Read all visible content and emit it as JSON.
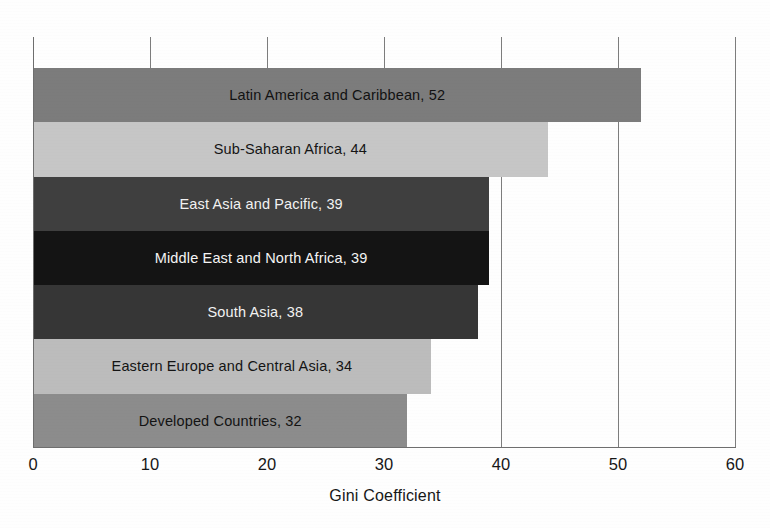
{
  "chart_data": {
    "type": "bar",
    "orientation": "horizontal",
    "title": "",
    "xlabel": "Gini Coefficient",
    "ylabel": "",
    "xlim": [
      0,
      60
    ],
    "xticks": [
      0,
      10,
      20,
      30,
      40,
      50,
      60
    ],
    "xtick_labels": [
      "0",
      "10",
      "20",
      "30",
      "40",
      "50",
      "60"
    ],
    "grid": true,
    "grid_axis": "x",
    "legend": false,
    "categories": [
      "Latin America and Caribbean",
      "Sub-Saharan Africa",
      "East Asia and Pacific",
      "Middle East and North Africa",
      "South Asia",
      "Eastern Europe and Central Asia",
      "Developed Countries"
    ],
    "values": [
      52,
      44,
      39,
      39,
      38,
      34,
      32
    ],
    "bar_labels": [
      "Latin America and Caribbean, 52",
      "Sub-Saharan Africa, 44",
      "East Asia and Pacific, 39",
      "Middle East and North Africa, 39",
      "South Asia, 38",
      "Eastern Europe and Central Asia, 34",
      "Developed Countries, 32"
    ],
    "bar_colors": [
      "#7c7c7c",
      "#c6c6c6",
      "#3f3f3f",
      "#141414",
      "#363636",
      "#bcbcbc",
      "#8c8c8c"
    ],
    "bar_label_colors": [
      "#121212",
      "#151515",
      "#f2f2f2",
      "#f4f4f4",
      "#f2f2f2",
      "#141414",
      "#131313"
    ]
  },
  "axis": {
    "grid_color": "#7d7d7d",
    "line_color": "#6e6e6e"
  }
}
